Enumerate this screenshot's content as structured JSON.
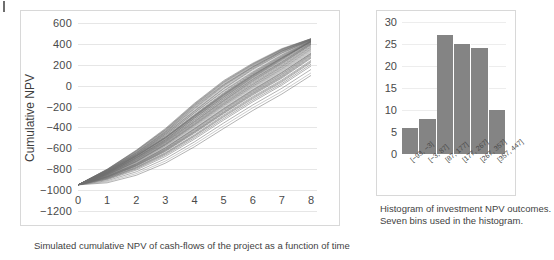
{
  "figure": {
    "caption_left": "Simulated cumulative NPV of cash-flows of the project as a function of time",
    "caption_right_line1": "Histogram of investment NPV outcomes.",
    "caption_right_line2": "Seven bins used in the histogram.",
    "line_color": "#6e6e6e",
    "bar_color": "#848484",
    "grid_color": "#e6e6e6",
    "frame_color": "#d8d8d8"
  },
  "chart_data": [
    {
      "type": "line",
      "id": "cumulative-npv-fan",
      "title": "",
      "xlabel": "",
      "ylabel": "Cumulative NPV",
      "xlim": [
        0,
        8
      ],
      "ylim": [
        -1200,
        600
      ],
      "ytick_step": 200,
      "grid": true,
      "legend": "none",
      "x": [
        0,
        1,
        2,
        3,
        4,
        5,
        6,
        7,
        8
      ],
      "xticklabels": [
        "0",
        "1",
        "2",
        "3",
        "4",
        "5",
        "6",
        "7",
        "8"
      ],
      "yticklabels": [
        "600",
        "400",
        "200",
        "0",
        "-200",
        "-400",
        "-600",
        "-800",
        "-1000",
        "-1200"
      ],
      "n_simulations": 60,
      "start_value": -950,
      "end_range": [
        -100,
        450
      ],
      "series": [
        {
          "name": "sim-1",
          "values": [
            -950,
            -820,
            -660,
            -470,
            -250,
            -40,
            140,
            300,
            445
          ]
        },
        {
          "name": "sim-2",
          "values": [
            -950,
            -835,
            -690,
            -520,
            -310,
            -110,
            80,
            250,
            430
          ]
        },
        {
          "name": "sim-3",
          "values": [
            -950,
            -810,
            -640,
            -440,
            -200,
            10,
            180,
            330,
            440
          ]
        },
        {
          "name": "sim-4",
          "values": [
            -950,
            -845,
            -710,
            -545,
            -350,
            -150,
            35,
            205,
            395
          ]
        },
        {
          "name": "sim-5",
          "values": [
            -950,
            -828,
            -672,
            -495,
            -285,
            -80,
            105,
            270,
            420
          ]
        },
        {
          "name": "sim-6",
          "values": [
            -950,
            -855,
            -725,
            -565,
            -375,
            -180,
            0,
            170,
            360
          ]
        },
        {
          "name": "sim-7",
          "values": [
            -950,
            -818,
            -655,
            -462,
            -240,
            -25,
            160,
            315,
            435
          ]
        },
        {
          "name": "sim-8",
          "values": [
            -950,
            -862,
            -740,
            -585,
            -400,
            -205,
            -25,
            140,
            330
          ]
        },
        {
          "name": "sim-9",
          "values": [
            -950,
            -805,
            -628,
            -425,
            -185,
            30,
            200,
            345,
            448
          ]
        },
        {
          "name": "sim-10",
          "values": [
            -950,
            -872,
            -758,
            -610,
            -430,
            -240,
            -60,
            105,
            295
          ]
        },
        {
          "name": "sim-11",
          "values": [
            -950,
            -832,
            -680,
            -505,
            -298,
            -95,
            92,
            260,
            425
          ]
        },
        {
          "name": "sim-12",
          "values": [
            -950,
            -848,
            -715,
            -552,
            -358,
            -158,
            25,
            195,
            385
          ]
        },
        {
          "name": "sim-13",
          "values": [
            -950,
            -812,
            -648,
            -452,
            -222,
            -5,
            172,
            322,
            438
          ]
        },
        {
          "name": "sim-14",
          "values": [
            -950,
            -880,
            -772,
            -630,
            -455,
            -268,
            -90,
            72,
            262
          ]
        },
        {
          "name": "sim-15",
          "values": [
            -950,
            -838,
            -692,
            -522,
            -318,
            -118,
            68,
            238,
            412
          ]
        },
        {
          "name": "sim-16",
          "values": [
            -950,
            -858,
            -732,
            -575,
            -388,
            -192,
            -12,
            155,
            345
          ]
        },
        {
          "name": "sim-17",
          "values": [
            -950,
            -800,
            -618,
            -410,
            -168,
            48,
            215,
            355,
            450
          ]
        },
        {
          "name": "sim-18",
          "values": [
            -950,
            -890,
            -790,
            -655,
            -485,
            -300,
            -125,
            35,
            222
          ]
        },
        {
          "name": "sim-19",
          "values": [
            -950,
            -825,
            -668,
            -488,
            -275,
            -68,
            118,
            282,
            428
          ]
        },
        {
          "name": "sim-20",
          "values": [
            -950,
            -868,
            -750,
            -598,
            -415,
            -225,
            -45,
            122,
            312
          ]
        },
        {
          "name": "sim-21",
          "values": [
            -950,
            -815,
            -652,
            -458,
            -232,
            -15,
            165,
            328,
            442
          ]
        },
        {
          "name": "sim-22",
          "values": [
            -950,
            -842,
            -702,
            -535,
            -338,
            -138,
            52,
            220,
            402
          ]
        },
        {
          "name": "sim-23",
          "values": [
            -950,
            -900,
            -808,
            -678,
            -512,
            -330,
            -155,
            5,
            188
          ]
        },
        {
          "name": "sim-24",
          "values": [
            -950,
            -830,
            -676,
            -500,
            -292,
            -88,
            98,
            265,
            422
          ]
        },
        {
          "name": "sim-25",
          "values": [
            -950,
            -852,
            -722,
            -560,
            -368,
            -170,
            12,
            182,
            372
          ]
        },
        {
          "name": "sim-26",
          "values": [
            -950,
            -808,
            -635,
            -435,
            -195,
            18,
            190,
            338,
            444
          ]
        },
        {
          "name": "sim-27",
          "values": [
            -950,
            -876,
            -765,
            -620,
            -442,
            -255,
            -75,
            88,
            278
          ]
        },
        {
          "name": "sim-28",
          "values": [
            -950,
            -836,
            -686,
            -512,
            -305,
            -102,
            85,
            255,
            418
          ]
        },
        {
          "name": "sim-29",
          "values": [
            -950,
            -864,
            -745,
            -592,
            -408,
            -215,
            -35,
            132,
            322
          ]
        },
        {
          "name": "sim-30",
          "values": [
            -950,
            -822,
            -662,
            -475,
            -258,
            -48,
            132,
            295,
            432
          ]
        },
        {
          "name": "sim-31",
          "values": [
            -950,
            -846,
            -708,
            -542,
            -345,
            -145,
            42,
            212,
            392
          ]
        },
        {
          "name": "sim-32",
          "values": [
            -950,
            -910,
            -825,
            -700,
            -538,
            -358,
            -185,
            -25,
            155
          ]
        },
        {
          "name": "sim-33",
          "values": [
            -950,
            -840,
            -696,
            -528,
            -325,
            -125,
            62,
            230,
            408
          ]
        },
        {
          "name": "sim-34",
          "values": [
            -950,
            -802,
            -622,
            -418,
            -175,
            40,
            208,
            350,
            449
          ]
        },
        {
          "name": "sim-35",
          "values": [
            -950,
            -884,
            -780,
            -642,
            -470,
            -282,
            -105,
            55,
            242
          ]
        },
        {
          "name": "sim-36",
          "values": [
            -950,
            -834,
            -684,
            -508,
            -300,
            -98,
            88,
            258,
            420
          ]
        },
        {
          "name": "sim-37",
          "values": [
            -950,
            -856,
            -728,
            -568,
            -380,
            -185,
            -5,
            162,
            352
          ]
        },
        {
          "name": "sim-38",
          "values": [
            -950,
            -818,
            -658,
            -466,
            -245,
            -30,
            152,
            310,
            434
          ]
        },
        {
          "name": "sim-39",
          "values": [
            -950,
            -870,
            -754,
            -605,
            -422,
            -232,
            -52,
            112,
            302
          ]
        },
        {
          "name": "sim-40",
          "values": [
            -950,
            -828,
            -674,
            -498,
            -288,
            -84,
            102,
            268,
            424
          ]
        },
        {
          "name": "sim-41",
          "values": [
            -950,
            -920,
            -842,
            -722,
            -562,
            -385,
            -212,
            -55,
            122
          ]
        },
        {
          "name": "sim-42",
          "values": [
            -950,
            -844,
            -706,
            -538,
            -342,
            -142,
            46,
            216,
            398
          ]
        },
        {
          "name": "sim-43",
          "values": [
            -950,
            -806,
            -632,
            -430,
            -190,
            24,
            195,
            342,
            446
          ]
        },
        {
          "name": "sim-44",
          "values": [
            -950,
            -878,
            -768,
            -625,
            -448,
            -262,
            -82,
            80,
            270
          ]
        },
        {
          "name": "sim-45",
          "values": [
            -950,
            -838,
            -690,
            -518,
            -312,
            -112,
            75,
            244,
            415
          ]
        },
        {
          "name": "sim-46",
          "values": [
            -950,
            -860,
            -736,
            -578,
            -392,
            -198,
            -18,
            148,
            338
          ]
        },
        {
          "name": "sim-47",
          "values": [
            -950,
            -814,
            -645,
            -448,
            -215,
            2,
            178,
            332,
            440
          ]
        },
        {
          "name": "sim-48",
          "values": [
            -950,
            -888,
            -785,
            -648,
            -478,
            -292,
            -115,
            45,
            232
          ]
        },
        {
          "name": "sim-49",
          "values": [
            -950,
            -826,
            -670,
            -492,
            -282,
            -75,
            112,
            276,
            426
          ]
        },
        {
          "name": "sim-50",
          "values": [
            -950,
            -850,
            -718,
            -555,
            -362,
            -165,
            18,
            188,
            378
          ]
        },
        {
          "name": "sim-51",
          "values": [
            -950,
            -810,
            -642,
            -442,
            -208,
            8,
            185,
            336,
            443
          ]
        },
        {
          "name": "sim-52",
          "values": [
            -950,
            -895,
            -798,
            -665,
            -498,
            -315,
            -140,
            20,
            205
          ]
        },
        {
          "name": "sim-53",
          "values": [
            -950,
            -832,
            -678,
            -502,
            -295,
            -92,
            95,
            262,
            423
          ]
        },
        {
          "name": "sim-54",
          "values": [
            -950,
            -866,
            -748,
            -595,
            -412,
            -220,
            -40,
            126,
            308
          ]
        },
        {
          "name": "sim-55",
          "values": [
            -950,
            -820,
            -664,
            -480,
            -262,
            -55,
            125,
            288,
            430
          ]
        },
        {
          "name": "sim-56",
          "values": [
            -950,
            -854,
            -726,
            -563,
            -372,
            -175,
            8,
            176,
            366
          ]
        },
        {
          "name": "sim-57",
          "values": [
            -950,
            -804,
            -625,
            -422,
            -180,
            35,
            205,
            348,
            447
          ]
        },
        {
          "name": "sim-58",
          "values": [
            -950,
            -874,
            -762,
            -615,
            -438,
            -250,
            -68,
            95,
            288
          ]
        },
        {
          "name": "sim-59",
          "values": [
            -950,
            -841,
            -698,
            -531,
            -330,
            -130,
            58,
            226,
            405
          ]
        },
        {
          "name": "sim-60",
          "values": [
            -950,
            -930,
            -858,
            -742,
            -585,
            -410,
            -238,
            -80,
            98
          ]
        }
      ]
    },
    {
      "type": "bar",
      "id": "npv-histogram",
      "title": "",
      "xlabel": "",
      "ylabel": "",
      "ylim": [
        0,
        30
      ],
      "ytick_step": 5,
      "grid": true,
      "legend": "none",
      "bins": 7,
      "categories": [
        "[-93, -3]",
        "[-3, 87]",
        "[87, 177]",
        "[177, 267]",
        "[267, 357]",
        "[357, 447]"
      ],
      "values": [
        6,
        8,
        27,
        25,
        24,
        10
      ],
      "yticklabels": [
        "30",
        "25",
        "20",
        "15",
        "10",
        "5",
        "0"
      ]
    }
  ]
}
